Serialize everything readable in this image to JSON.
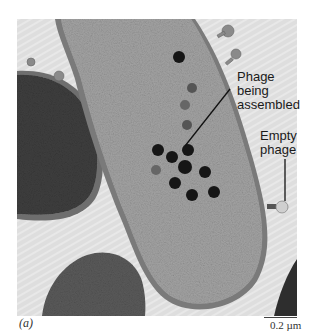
{
  "figure": {
    "panel_label": "(a)",
    "scale_bar": {
      "label": "0.2 µm"
    },
    "annotations": [
      {
        "id": "phage-assembled",
        "lines": [
          "Phage",
          "being",
          "assembled"
        ]
      },
      {
        "id": "empty-phage",
        "lines": [
          "Empty",
          "phage"
        ]
      }
    ],
    "image": {
      "subject": "electron micrograph of bacterial cell with phage",
      "background_color": "#dcdcdc",
      "cell_color": "#9a9a9a",
      "dark_cell_color": "#3a3a3a",
      "phage_head_color": "#151515"
    }
  }
}
